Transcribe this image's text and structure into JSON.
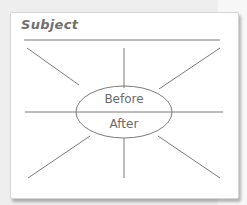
{
  "diagram": {
    "subject_label": "Subject",
    "ellipse": {
      "top_label": "Before",
      "bottom_label": "After"
    },
    "spokes": {
      "top_count": 3,
      "bottom_count": 3
    },
    "colors": {
      "line": "#7a7a7a",
      "text": "#6f6f6f",
      "card": "#ffffff",
      "background": "#eeeeee"
    }
  }
}
